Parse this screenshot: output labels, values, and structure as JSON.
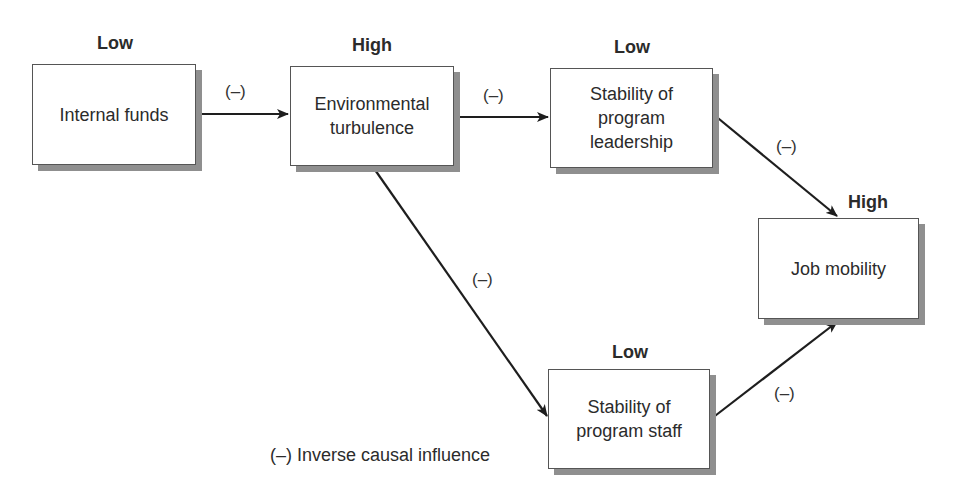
{
  "diagram": {
    "type": "causal-path-diagram",
    "nodes": [
      {
        "id": "internal_funds",
        "label_lines": [
          "Internal funds"
        ],
        "level": "Low"
      },
      {
        "id": "environmental_turbulence",
        "label_lines": [
          "Environmental",
          "turbulence"
        ],
        "level": "High"
      },
      {
        "id": "stability_leadership",
        "label_lines": [
          "Stability of",
          "program",
          "leadership"
        ],
        "level": "Low"
      },
      {
        "id": "job_mobility",
        "label_lines": [
          "Job mobility"
        ],
        "level": "High"
      },
      {
        "id": "stability_staff",
        "label_lines": [
          "Stability of",
          "program staff"
        ],
        "level": "Low"
      }
    ],
    "edges": [
      {
        "from": "internal_funds",
        "to": "environmental_turbulence",
        "sign": "(–)"
      },
      {
        "from": "environmental_turbulence",
        "to": "stability_leadership",
        "sign": "(–)"
      },
      {
        "from": "stability_leadership",
        "to": "job_mobility",
        "sign": "(–)"
      },
      {
        "from": "environmental_turbulence",
        "to": "stability_staff",
        "sign": "(–)"
      },
      {
        "from": "stability_staff",
        "to": "job_mobility",
        "sign": "(–)"
      }
    ],
    "legend": "(–) Inverse causal influence",
    "colors": {
      "box_border": "#555555",
      "box_shadow": "#8f8f8f",
      "arrow": "#1e1e1e",
      "text": "#2b2b2b"
    }
  }
}
